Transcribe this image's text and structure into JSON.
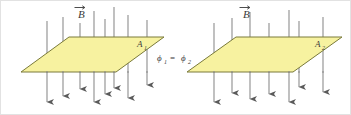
{
  "figure": {
    "name": "magnetic-flux-equal-areas-diagram",
    "background_color": "#ffffff",
    "border_color": "#e2e2e2",
    "plane_fill_color": "#f7f2a0",
    "plane_stroke_color": "#7a7a3a",
    "arrow_color": "#666666",
    "label_color": "#3a3a3a"
  },
  "left_panel": {
    "field_label": "B",
    "field_label_vector_accent": "→",
    "area_label": "A",
    "area_label_subscript": "1",
    "plane": {
      "points": "68,36 163,36 115,71 20,71"
    },
    "field_lines": [
      {
        "x": 46,
        "y_top": 20,
        "y_bottom": 101
      },
      {
        "x": 62,
        "y_top": 16,
        "y_bottom": 95
      },
      {
        "x": 79,
        "y_top": 22,
        "y_bottom": 88
      },
      {
        "x": 93,
        "y_top": 10,
        "y_bottom": 101
      },
      {
        "x": 104,
        "y_top": 18,
        "y_bottom": 93
      },
      {
        "x": 113,
        "y_top": 6,
        "y_bottom": 87
      },
      {
        "x": 127,
        "y_top": 14,
        "y_bottom": 97
      },
      {
        "x": 146,
        "y_top": 19,
        "y_bottom": 84
      }
    ]
  },
  "center": {
    "relation_lhs": "ϕ",
    "relation_lhs_subscript": "1",
    "relation_operator": "=",
    "relation_rhs": "ϕ",
    "relation_rhs_subscript": "2",
    "relation_text": "ϕ1 = ϕ2"
  },
  "right_panel": {
    "field_label": "B",
    "field_label_vector_accent": "→",
    "area_label": "A",
    "area_label_subscript": "2",
    "plane": {
      "points": "235,36 341,36 292,71 186,71"
    },
    "field_lines": [
      {
        "x": 213,
        "y_top": 22,
        "y_bottom": 101
      },
      {
        "x": 231,
        "y_top": 17,
        "y_bottom": 92
      },
      {
        "x": 249,
        "y_top": 11,
        "y_bottom": 98
      },
      {
        "x": 268,
        "y_top": 22,
        "y_bottom": 93
      },
      {
        "x": 288,
        "y_top": 9,
        "y_bottom": 101
      },
      {
        "x": 298,
        "y_top": 20,
        "y_bottom": 86
      },
      {
        "x": 322,
        "y_top": 16,
        "y_bottom": 91
      }
    ]
  }
}
